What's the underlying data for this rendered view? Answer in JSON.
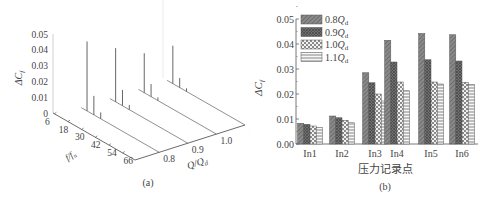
{
  "chart_data": [
    {
      "type": "3d-spectrum",
      "panel_label": "(a)",
      "zlabel": "ΔCf",
      "z_ticks": [
        "0",
        "0.01",
        "0.02",
        "0.03",
        "0.04",
        "0.05"
      ],
      "xlabel": "f/fn",
      "x_ticks": [
        "6",
        "18",
        "30",
        "42",
        "54",
        "66"
      ],
      "ylabel": "Q/Qd",
      "y_ticks": [
        "0.8",
        "0.9",
        "1.0",
        "1.1"
      ],
      "series": [
        {
          "name": "0.8Qd",
          "peaks": [
            {
              "f": 6,
              "value": 0.044
            },
            {
              "f": 12,
              "value": 0.012
            },
            {
              "f": 18,
              "value": 0.004
            }
          ]
        },
        {
          "name": "0.9Qd",
          "peaks": [
            {
              "f": 6,
              "value": 0.034
            },
            {
              "f": 12,
              "value": 0.01
            },
            {
              "f": 18,
              "value": 0.003
            }
          ]
        },
        {
          "name": "1.0Qd",
          "peaks": [
            {
              "f": 6,
              "value": 0.025
            },
            {
              "f": 12,
              "value": 0.008
            },
            {
              "f": 18,
              "value": 0.002
            }
          ]
        },
        {
          "name": "1.1Qd",
          "peaks": [
            {
              "f": 6,
              "value": 0.024
            },
            {
              "f": 12,
              "value": 0.006
            },
            {
              "f": 18,
              "value": 0.002
            }
          ]
        }
      ]
    },
    {
      "type": "bar",
      "panel_label": "(b)",
      "xlabel": "压力记录点",
      "ylabel": "ΔCf",
      "ylim": [
        0,
        0.05
      ],
      "y_ticks": [
        "0.00",
        "0.01",
        "0.02",
        "0.03",
        "0.04",
        "0.05"
      ],
      "categories": [
        "In1",
        "In2",
        "In3",
        "In4",
        "In5",
        "In6"
      ],
      "legend_position": "upper-left",
      "series": [
        {
          "name": "0.8Qd",
          "pattern": "dense-diagonal",
          "values": [
            0.0083,
            0.0112,
            0.0285,
            0.0415,
            0.0442,
            0.0437
          ]
        },
        {
          "name": "0.9Qd",
          "pattern": "cross-hatch-dark",
          "values": [
            0.0079,
            0.0105,
            0.0245,
            0.0328,
            0.0337,
            0.0332
          ]
        },
        {
          "name": "1.0Qd",
          "pattern": "checker",
          "values": [
            0.0072,
            0.0095,
            0.02,
            0.0248,
            0.0248,
            0.0247
          ]
        },
        {
          "name": "1.1Qd",
          "pattern": "horizontal-lines",
          "values": [
            0.0066,
            0.0085,
            0.0172,
            0.0213,
            0.024,
            0.0238
          ]
        }
      ]
    }
  ],
  "legend": {
    "items": [
      {
        "coef": "0.8",
        "sym": "Q",
        "sub": "d"
      },
      {
        "coef": "0.9",
        "sym": "Q",
        "sub": "d"
      },
      {
        "coef": "1.0",
        "sym": "Q",
        "sub": "d"
      },
      {
        "coef": "1.1",
        "sym": "Q",
        "sub": "d"
      }
    ]
  }
}
